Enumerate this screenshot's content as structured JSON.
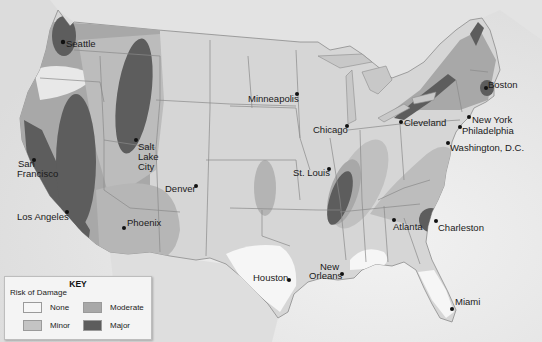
{
  "map": {
    "title": "Earthquake Risk of Damage — United States",
    "colors": {
      "land": "#d9d9d9",
      "water": "#e9e9e9",
      "border": "#8c8c8c",
      "none": "#f6f6f6",
      "minor": "#c4c4c4",
      "moderate": "#a8a8a8",
      "major": "#5d5d5d"
    },
    "cities": [
      {
        "name": "Seattle",
        "x": 63,
        "y": 42
      },
      {
        "name": "San Francisco",
        "x": 34,
        "y": 160
      },
      {
        "name": "Los Angeles",
        "x": 67,
        "y": 212
      },
      {
        "name": "Salt Lake City",
        "x": 136,
        "y": 140
      },
      {
        "name": "Denver",
        "x": 196,
        "y": 186
      },
      {
        "name": "Phoenix",
        "x": 124,
        "y": 228
      },
      {
        "name": "Minneapolis",
        "x": 297,
        "y": 94
      },
      {
        "name": "Chicago",
        "x": 347,
        "y": 126
      },
      {
        "name": "Cleveland",
        "x": 401,
        "y": 122
      },
      {
        "name": "New York",
        "x": 469,
        "y": 117
      },
      {
        "name": "Boston",
        "x": 486,
        "y": 88
      },
      {
        "name": "Philadelphia",
        "x": 460,
        "y": 127
      },
      {
        "name": "Washington, D.C.",
        "x": 448,
        "y": 143
      },
      {
        "name": "St. Louis",
        "x": 329,
        "y": 169
      },
      {
        "name": "Atlanta",
        "x": 394,
        "y": 220
      },
      {
        "name": "Charleston",
        "x": 436,
        "y": 221
      },
      {
        "name": "Houston",
        "x": 289,
        "y": 280
      },
      {
        "name": "New Orleans",
        "x": 342,
        "y": 274
      },
      {
        "name": "Miami",
        "x": 452,
        "y": 309
      }
    ],
    "labels": {
      "seattle": "Seattle",
      "san_francisco_1": "San",
      "san_francisco_2": "Francisco",
      "los_angeles": "Los Angeles",
      "salt_lake_1": "Salt",
      "salt_lake_2": "Lake",
      "salt_lake_3": "City",
      "denver": "Denver",
      "phoenix": "Phoenix",
      "minneapolis": "Minneapolis",
      "chicago": "Chicago",
      "cleveland": "Cleveland",
      "new_york": "New York",
      "boston": "Boston",
      "philadelphia": "Philadelphia",
      "washington": "Washington, D.C.",
      "st_louis": "St. Louis",
      "atlanta": "Atlanta",
      "charleston": "Charleston",
      "houston": "Houston",
      "new_orleans_1": "New",
      "new_orleans_2": "Orleans",
      "miami": "Miami"
    }
  },
  "key": {
    "title": "KEY",
    "subtitle": "Risk of Damage",
    "items": [
      {
        "label": "None",
        "color": "#f6f6f6"
      },
      {
        "label": "Minor",
        "color": "#c4c4c4"
      },
      {
        "label": "Moderate",
        "color": "#a8a8a8"
      },
      {
        "label": "Major",
        "color": "#5d5d5d"
      }
    ]
  }
}
